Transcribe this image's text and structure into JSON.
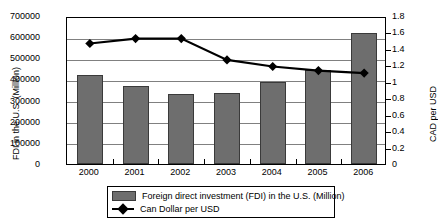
{
  "chart_data": {
    "type": "bar",
    "title": "",
    "xlabel": "",
    "ylabel": "FDI in the U.S. (Million)",
    "y2label": "CAD per USD",
    "categories": [
      "2000",
      "2001",
      "2002",
      "2003",
      "2004",
      "2005",
      "2006"
    ],
    "ylim": [
      0,
      700000
    ],
    "y2lim": [
      0,
      1.8
    ],
    "yticks": [
      "0",
      "100000",
      "200000",
      "300000",
      "400000",
      "500000",
      "600000",
      "700000"
    ],
    "y2ticks": [
      "0",
      "0.2",
      "0.4",
      "0.6",
      "0.8",
      "1",
      "1.2",
      "1.4",
      "1.6",
      "1.8"
    ],
    "grid": true,
    "legend_position": "bottom",
    "series": [
      {
        "name": "Foreign direct investment (FDI) in the U.S. (Million)",
        "type": "bar",
        "axis": "left",
        "color": "#6e6e6e",
        "values": [
          420000,
          370000,
          330000,
          335000,
          388000,
          445000,
          620000
        ]
      },
      {
        "name": "Can Dollar per USD",
        "type": "line",
        "axis": "right",
        "color": "#000000",
        "values": [
          1.49,
          1.55,
          1.55,
          1.29,
          1.21,
          1.16,
          1.13
        ]
      }
    ]
  },
  "legend": {
    "items": [
      {
        "label": "Foreign direct investment (FDI) in the U.S. (Million)",
        "marker": "bar-swatch"
      },
      {
        "label": "Can Dollar per USD",
        "marker": "line-diamond-marker"
      }
    ]
  }
}
